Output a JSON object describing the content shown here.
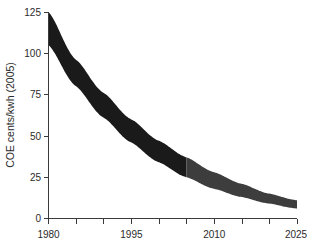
{
  "chart_data": {
    "type": "area",
    "title": "",
    "subtitle": "",
    "xlabel": "",
    "ylabel": "COE cents/kwh (2005)",
    "xlim": [
      1980,
      2025
    ],
    "ylim": [
      0,
      125
    ],
    "grid": false,
    "legend_position": "none",
    "y_ticks": [
      0,
      25,
      50,
      75,
      100,
      125
    ],
    "y_tick_labels": [
      "0",
      "25",
      "50",
      "75",
      "100",
      "125"
    ],
    "x_ticks": [
      1980,
      1995,
      2010,
      2025
    ],
    "x_tick_labels": [
      "1980",
      "1995",
      "2010",
      "2025"
    ],
    "x_minor_ticks": [
      1985,
      1990,
      2000,
      2005,
      2015,
      2020
    ],
    "split_year": 2005,
    "colors": {
      "historical_band": "#1a1a1a",
      "projected_band": "#3d3d3d",
      "axis": "#3a3a3a",
      "text": "#2b2b2b",
      "background": "#ffffff"
    },
    "x": [
      1980,
      1985,
      1990,
      1995,
      2000,
      2005,
      2010,
      2015,
      2020,
      2025
    ],
    "series": [
      {
        "name": "upper bound",
        "values": [
          125,
          96,
          76,
          60,
          47,
          37,
          28,
          21,
          15,
          11
        ]
      },
      {
        "name": "lower bound",
        "values": [
          105,
          80,
          61,
          46,
          34,
          25,
          18,
          13,
          9,
          6
        ]
      }
    ],
    "annotations": [
      {
        "label": "historical segment",
        "x_range": [
          1980,
          2005
        ],
        "color": "#1a1a1a"
      },
      {
        "label": "projected segment",
        "x_range": [
          2005,
          2025
        ],
        "color": "#3d3d3d"
      }
    ]
  },
  "axes": {
    "y_label": "COE cents/kwh (2005)",
    "x_label": "",
    "y_tick_0": "0",
    "y_tick_25": "25",
    "y_tick_50": "50",
    "y_tick_75": "75",
    "y_tick_100": "100",
    "y_tick_125": "125",
    "x_tick_1980": "1980",
    "x_tick_1995": "1995",
    "x_tick_2010": "2010",
    "x_tick_2025": "2025"
  }
}
